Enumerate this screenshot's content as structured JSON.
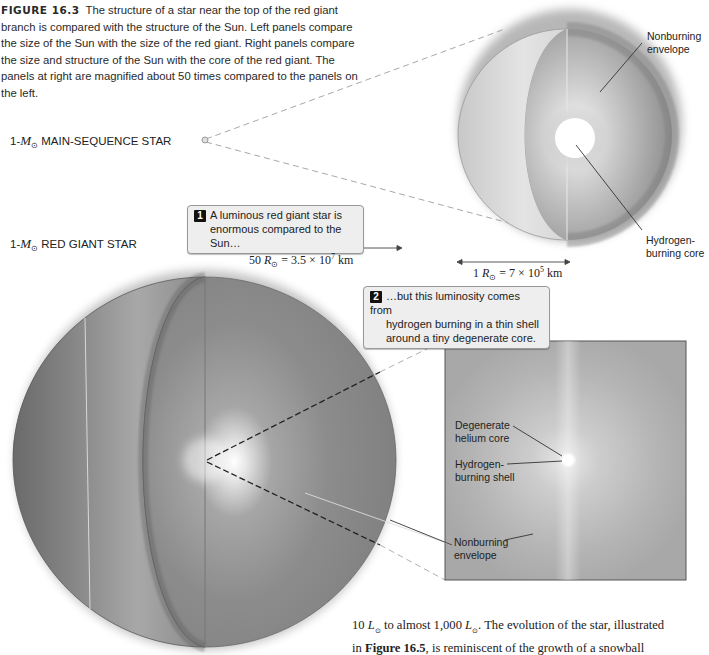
{
  "caption": {
    "figure_label": "FIGURE 16.3",
    "text": "The structure of a star near the top of the red giant branch is compared with the structure of the Sun. Left panels compare the size of the Sun with the size of the red giant. Right panels compare the size and structure of the Sun with the core of the red giant. The panels at right are magnified about 50 times compared to the panels on the left."
  },
  "labels": {
    "main_sequence": {
      "prefix": "1-",
      "mass_symbol": "M",
      "sub": "⊙",
      "text": " MAIN-SEQUENCE STAR"
    },
    "red_giant": {
      "prefix": "1-",
      "mass_symbol": "M",
      "sub": "⊙",
      "text": " RED GIANT STAR"
    }
  },
  "callouts": [
    {
      "number": "1",
      "line1": "A luminous red giant star is",
      "line2": "enormous compared to the Sun…"
    },
    {
      "number": "2",
      "line1": "…but this luminosity comes from",
      "line2": "hydrogen burning in a thin shell",
      "line3": "around a tiny degenerate core."
    }
  ],
  "scales": {
    "red_giant": {
      "prefix": "50 ",
      "symbol": "R",
      "sub": "⊙",
      "rest": " = 3.5 × 10",
      "exp": "7",
      "unit": " km"
    },
    "sun": {
      "prefix": "1 ",
      "symbol": "R",
      "sub": "⊙",
      "rest": " = 7 × 10",
      "exp": "5",
      "unit": " km"
    }
  },
  "annotations": {
    "sun_envelope": {
      "line1": "Nonburning",
      "line2": "envelope"
    },
    "sun_core": {
      "line1": "Hydrogen-",
      "line2": "burning core"
    },
    "giant_core": {
      "line1": "Degenerate",
      "line2": "helium core"
    },
    "giant_shell": {
      "line1": "Hydrogen-",
      "line2": "burning shell"
    },
    "giant_envelope": {
      "line1": "Nonburning",
      "line2": "envelope"
    }
  },
  "body_text": {
    "line1_a": "10 ",
    "line1_L1": "L",
    "line1_b": " to almost 1,000 ",
    "line1_L2": "L",
    "line1_c": ". The evolution of the star, illustrated",
    "line2_a": "in ",
    "line2_bold": "Figure 16.5",
    "line2_c": ", is reminiscent of the growth of a snowball",
    "sun_sub": "⊙"
  },
  "colors": {
    "giant_dark": "#6e6e6e",
    "giant_light": "#b5b5b5",
    "sun_light": "#d8d8d8",
    "callout_bg": "#eeeeee",
    "core_white": "#ffffff"
  }
}
